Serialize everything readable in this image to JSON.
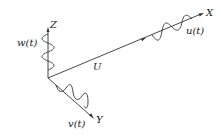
{
  "diagram": {
    "type": "3D coordinate axes with velocity fluctuation components",
    "axes": {
      "x": "X",
      "y": "Y",
      "z": "Z"
    },
    "mean_flow_label": "U",
    "components": {
      "u": "u(t)",
      "v": "v(t)",
      "w": "w(t)"
    },
    "colors": {
      "line": "#333333",
      "text": "#222222",
      "background": "#ffffff"
    }
  }
}
